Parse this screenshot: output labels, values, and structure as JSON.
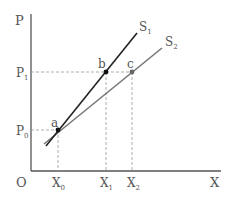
{
  "diagram": {
    "axes": {
      "y_label": "P",
      "x_label": "X",
      "origin_label": "O"
    },
    "y_ticks": [
      {
        "base": "P",
        "sub": "1"
      },
      {
        "base": "P",
        "sub": "0"
      }
    ],
    "x_ticks": [
      {
        "base": "X",
        "sub": "0"
      },
      {
        "base": "X",
        "sub": "1"
      },
      {
        "base": "X",
        "sub": "2"
      }
    ],
    "curves": [
      {
        "base": "S",
        "sub": "1",
        "color": "#222222"
      },
      {
        "base": "S",
        "sub": "2",
        "color": "#777777"
      }
    ],
    "points": [
      {
        "label": "a"
      },
      {
        "label": "b"
      },
      {
        "label": "c"
      }
    ],
    "colors": {
      "axis": "#555555",
      "guide": "#999999",
      "s1": "#222222",
      "s2": "#777777"
    }
  }
}
